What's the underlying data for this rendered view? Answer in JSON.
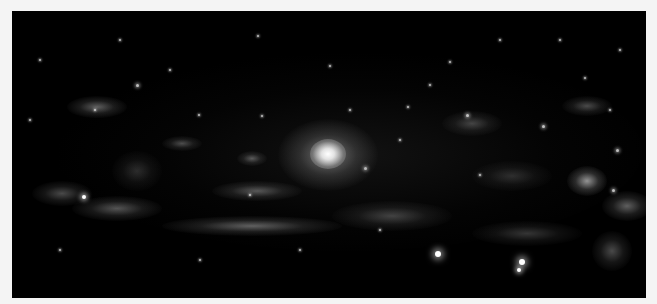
{
  "image": {
    "subject": "spiral galaxy",
    "background_color": "#000000",
    "border_color": "#f4f4f4"
  },
  "core": {
    "cx": 316,
    "cy": 143,
    "r": 40
  },
  "arm_clumps": [
    {
      "x": 55,
      "y": 85,
      "w": 60,
      "h": 22,
      "o": 0.45
    },
    {
      "x": 20,
      "y": 170,
      "w": 60,
      "h": 25,
      "o": 0.35
    },
    {
      "x": 60,
      "y": 185,
      "w": 90,
      "h": 25,
      "o": 0.4
    },
    {
      "x": 150,
      "y": 205,
      "w": 180,
      "h": 20,
      "o": 0.45
    },
    {
      "x": 200,
      "y": 170,
      "w": 90,
      "h": 20,
      "o": 0.4
    },
    {
      "x": 150,
      "y": 125,
      "w": 40,
      "h": 15,
      "o": 0.35
    },
    {
      "x": 225,
      "y": 140,
      "w": 30,
      "h": 15,
      "o": 0.4
    },
    {
      "x": 320,
      "y": 190,
      "w": 120,
      "h": 30,
      "o": 0.3
    },
    {
      "x": 430,
      "y": 100,
      "w": 60,
      "h": 25,
      "o": 0.3
    },
    {
      "x": 550,
      "y": 85,
      "w": 50,
      "h": 20,
      "o": 0.35
    },
    {
      "x": 555,
      "y": 155,
      "w": 40,
      "h": 30,
      "o": 0.7
    },
    {
      "x": 590,
      "y": 180,
      "w": 50,
      "h": 30,
      "o": 0.45
    },
    {
      "x": 580,
      "y": 220,
      "w": 40,
      "h": 40,
      "o": 0.35
    },
    {
      "x": 460,
      "y": 210,
      "w": 110,
      "h": 25,
      "o": 0.25
    },
    {
      "x": 100,
      "y": 140,
      "w": 50,
      "h": 40,
      "o": 0.2
    },
    {
      "x": 460,
      "y": 150,
      "w": 80,
      "h": 30,
      "o": 0.2
    }
  ],
  "stars": [
    {
      "x": 438,
      "y": 254,
      "r": 3
    },
    {
      "x": 522,
      "y": 262,
      "r": 3
    },
    {
      "x": 519,
      "y": 270,
      "r": 2
    },
    {
      "x": 84,
      "y": 197,
      "r": 2
    },
    {
      "x": 365,
      "y": 168,
      "r": 1.5
    },
    {
      "x": 617,
      "y": 150,
      "r": 1.5
    },
    {
      "x": 137,
      "y": 85,
      "r": 1.5
    },
    {
      "x": 467,
      "y": 115,
      "r": 1.5
    },
    {
      "x": 543,
      "y": 126,
      "r": 1.5
    },
    {
      "x": 613,
      "y": 190,
      "r": 1.5
    },
    {
      "x": 262,
      "y": 116,
      "r": 1
    },
    {
      "x": 408,
      "y": 107,
      "r": 1
    },
    {
      "x": 199,
      "y": 115,
      "r": 1
    },
    {
      "x": 330,
      "y": 66,
      "r": 1
    },
    {
      "x": 450,
      "y": 62,
      "r": 1
    },
    {
      "x": 585,
      "y": 78,
      "r": 1
    },
    {
      "x": 258,
      "y": 36,
      "r": 1
    },
    {
      "x": 120,
      "y": 40,
      "r": 1
    },
    {
      "x": 40,
      "y": 60,
      "r": 1
    },
    {
      "x": 500,
      "y": 40,
      "r": 1
    },
    {
      "x": 620,
      "y": 50,
      "r": 1
    },
    {
      "x": 300,
      "y": 250,
      "r": 1
    },
    {
      "x": 200,
      "y": 260,
      "r": 1
    },
    {
      "x": 60,
      "y": 250,
      "r": 1
    },
    {
      "x": 380,
      "y": 230,
      "r": 1
    },
    {
      "x": 560,
      "y": 40,
      "r": 1
    },
    {
      "x": 170,
      "y": 70,
      "r": 1
    },
    {
      "x": 400,
      "y": 140,
      "r": 1
    },
    {
      "x": 480,
      "y": 175,
      "r": 1
    },
    {
      "x": 250,
      "y": 195,
      "r": 1
    },
    {
      "x": 30,
      "y": 120,
      "r": 1
    },
    {
      "x": 610,
      "y": 110,
      "r": 1
    },
    {
      "x": 350,
      "y": 110,
      "r": 1
    },
    {
      "x": 430,
      "y": 85,
      "r": 1
    },
    {
      "x": 95,
      "y": 110,
      "r": 1
    }
  ]
}
